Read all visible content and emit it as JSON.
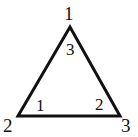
{
  "figure": {
    "type": "triangle-diagram",
    "background_color": "#ffffff",
    "stroke_color": "#111111",
    "stroke_width": 3,
    "vertices": [
      {
        "id": "apex",
        "label": "1",
        "x": 70,
        "y": 27
      },
      {
        "id": "bottom-left",
        "label": "2",
        "x": 18,
        "y": 116
      },
      {
        "id": "bottom-right",
        "label": "3",
        "x": 120,
        "y": 116
      }
    ],
    "vertex_labels": {
      "apex": "1",
      "bottom_left": "2",
      "bottom_right": "3"
    },
    "angle_labels": {
      "apex": "3",
      "bottom_left": "1",
      "bottom_right": "2"
    }
  },
  "chart_data": {
    "type": "diagram",
    "title": "",
    "shape": "triangle",
    "points": [
      {
        "name": "1",
        "x": 70,
        "y": 27
      },
      {
        "name": "2",
        "x": 18,
        "y": 116
      },
      {
        "name": "3",
        "x": 120,
        "y": 116
      }
    ],
    "edges": [
      {
        "from": "1",
        "to": "2"
      },
      {
        "from": "2",
        "to": "3"
      },
      {
        "from": "3",
        "to": "1"
      }
    ],
    "interior_angle_labels": [
      {
        "at_vertex": "1",
        "label": "3"
      },
      {
        "at_vertex": "2",
        "label": "1"
      },
      {
        "at_vertex": "3",
        "label": "2"
      }
    ],
    "exterior_vertex_labels": [
      {
        "at_vertex": "1",
        "label": "1"
      },
      {
        "at_vertex": "2",
        "label": "2"
      },
      {
        "at_vertex": "3",
        "label": "3"
      }
    ]
  }
}
